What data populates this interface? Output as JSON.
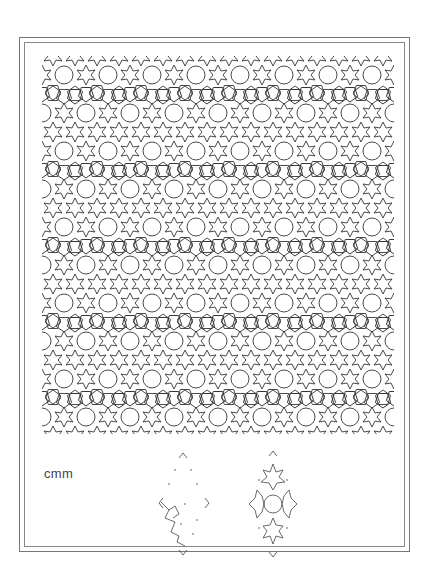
{
  "page": {
    "background": "#ffffff",
    "line_color": "#333333",
    "frame_color": "#777777"
  },
  "pattern": {
    "description": "Periodic tiling of six-pointed stars, pentagons and circular polygons (rosettes)",
    "tile_w": 44,
    "tile_h": 76
  },
  "symmetry": {
    "group_label": "cmm",
    "units": [
      {
        "name": "fundamental-region",
        "description": "Rhombic cell with dotted outline containing partial star motif"
      },
      {
        "name": "translation-unit",
        "description": "Rhombic cell with four star motifs around central circle"
      }
    ]
  }
}
